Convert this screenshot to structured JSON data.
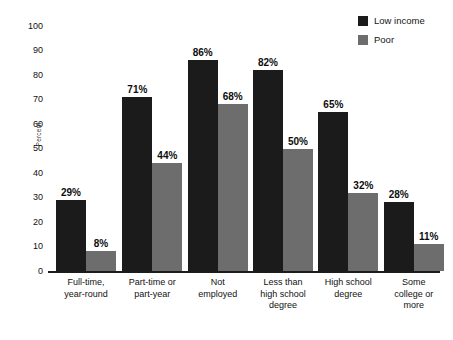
{
  "chart_data": {
    "type": "bar",
    "title": "",
    "subtitle": "",
    "xlabel": "",
    "ylabel": "Percent",
    "ylim": [
      0,
      100
    ],
    "ytick_step": 10,
    "yticks": [
      "100",
      "90",
      "80",
      "70",
      "60",
      "50",
      "40",
      "30",
      "20",
      "10",
      "0"
    ],
    "grid": false,
    "legend_position": "top-right",
    "value_suffix": "%",
    "categories": [
      "Full-time, year-round",
      "Part-time or part-year",
      "Not employed",
      "Less than high school degree",
      "High school degree",
      "Some college or more"
    ],
    "category_lines": [
      [
        "Full-time,",
        "year-round"
      ],
      [
        "Part-time or",
        "part-year"
      ],
      [
        "Not",
        "employed"
      ],
      [
        "Less than",
        "high school",
        "degree"
      ],
      [
        "High school",
        "degree"
      ],
      [
        "Some",
        "college or",
        "more"
      ]
    ],
    "series": [
      {
        "name": "Low income",
        "color": "#1b1b1b",
        "values": [
          29,
          71,
          86,
          82,
          65,
          28
        ],
        "labels": [
          "29%",
          "71%",
          "86%",
          "82%",
          "65%",
          "28%"
        ]
      },
      {
        "name": "Poor",
        "color": "#6d6d6d",
        "values": [
          8,
          44,
          68,
          50,
          32,
          11
        ],
        "labels": [
          "8%",
          "44%",
          "68%",
          "50%",
          "32%",
          "11%"
        ]
      }
    ]
  },
  "legend": {
    "items": [
      {
        "label": "Low income",
        "color": "#1b1b1b"
      },
      {
        "label": "Poor",
        "color": "#6d6d6d"
      }
    ]
  },
  "axis": {
    "y_title": "Percent"
  },
  "colors": {
    "low_income": "#1b1b1b",
    "poor": "#6d6d6d",
    "baseline": "#1c1c1c",
    "background": "#ffffff",
    "text": "#111111"
  }
}
